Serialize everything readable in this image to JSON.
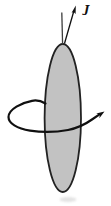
{
  "figure": {
    "type": "physics-diagram",
    "labels": {
      "angular_momentum": "J"
    },
    "colors": {
      "background": "#ffffff",
      "body_fill": "#c2c2c2",
      "body_stroke": "#222222",
      "axis_line": "#3d3d3d",
      "arrow": "#101010",
      "shadow": "#dcdcdc"
    }
  }
}
